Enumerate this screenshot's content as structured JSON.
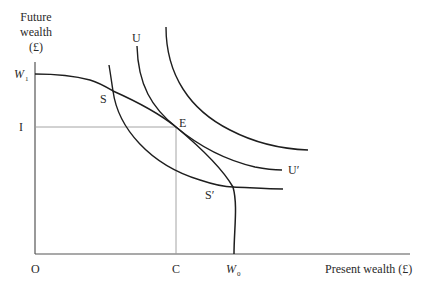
{
  "diagram": {
    "axes": {
      "y_label_lines": [
        "Future",
        "wealth",
        "(£)"
      ],
      "x_label": "Present wealth (£)",
      "origin_label": "O"
    },
    "y_ticks": {
      "w1": {
        "main": "W",
        "sub": "1"
      },
      "i": "I"
    },
    "x_ticks": {
      "c": "C",
      "w0": {
        "main": "W",
        "sub": "0"
      }
    },
    "points": {
      "s": "S",
      "e": "E",
      "s_prime": "S′"
    },
    "curves": {
      "u_top_label": "U",
      "u_prime_label": "U′"
    },
    "colors": {
      "curve": "#1e1e1e",
      "guide": "#9a9a9a",
      "axis": "#555555",
      "text": "#2a2a2a"
    }
  }
}
